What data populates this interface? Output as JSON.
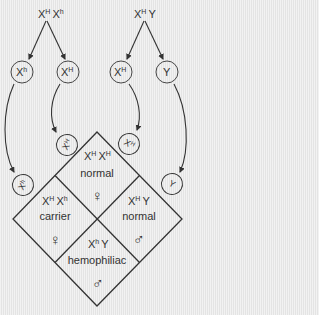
{
  "parents": {
    "mother": {
      "base1": "X",
      "sup1": "H",
      "base2": "X",
      "sup2": "h"
    },
    "father": {
      "base1": "X",
      "sup1": "H",
      "base2": "Y",
      "sup2": ""
    }
  },
  "gametes": {
    "mother": [
      {
        "base": "X",
        "sup": "h"
      },
      {
        "base": "X",
        "sup": "H"
      }
    ],
    "father": [
      {
        "base": "X",
        "sup": "H"
      },
      {
        "base": "Y",
        "sup": ""
      }
    ]
  },
  "cells": {
    "top": {
      "base1": "X",
      "sup1": "H",
      "base2": "X",
      "sup2": "H",
      "status": "normal",
      "sex_symbol": "♀"
    },
    "left": {
      "base1": "X",
      "sup1": "H",
      "base2": "X",
      "sup2": "h",
      "status": "carrier",
      "sex_symbol": "♀"
    },
    "right": {
      "base1": "X",
      "sup1": "H",
      "base2": "Y",
      "sup2": "",
      "status": "normal",
      "sex_symbol": "♂"
    },
    "bottom": {
      "base1": "X",
      "sup1": "h",
      "base2": "Y",
      "sup2": "",
      "status": "hemophiliac",
      "sex_symbol": "♂"
    }
  },
  "colors": {
    "line": "#333333",
    "background": "#ebebeb"
  }
}
